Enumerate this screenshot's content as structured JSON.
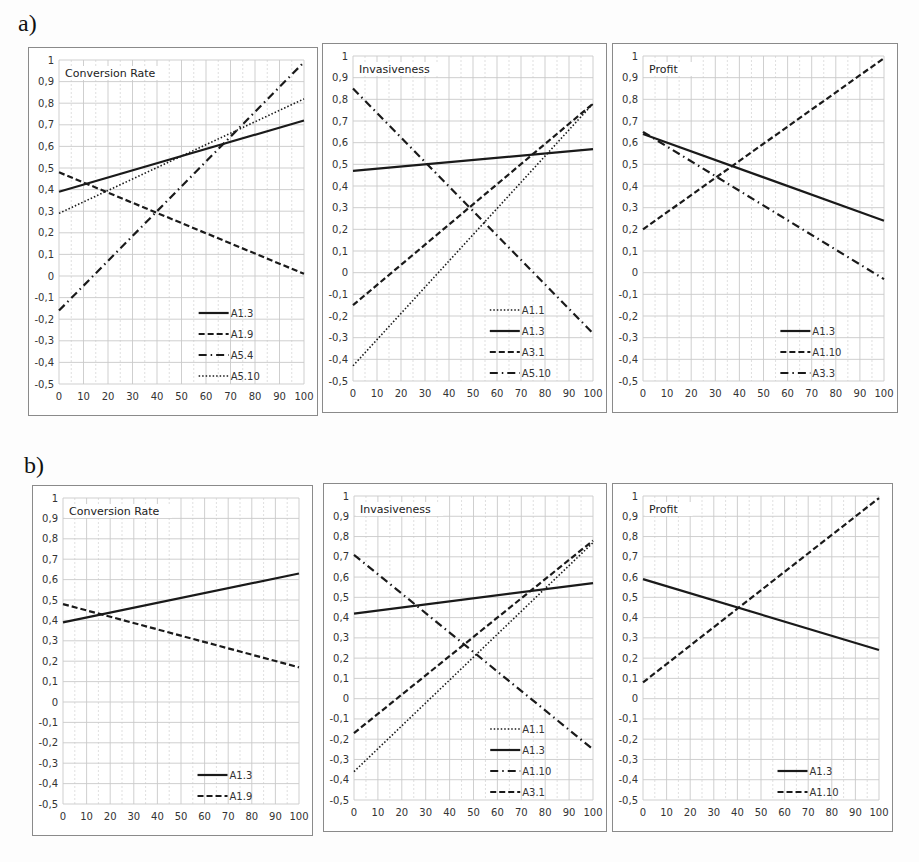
{
  "labels": {
    "row_a": "a)",
    "row_b": "b)"
  },
  "chart_data": [
    {
      "id": "a1",
      "row": "a",
      "type": "line",
      "title": "Conversion Rate",
      "xlabel": "",
      "ylabel": "",
      "x_ticks": [
        "0",
        "10",
        "20",
        "30",
        "40",
        "50",
        "60",
        "70",
        "80",
        "90",
        "100"
      ],
      "y_ticks": [
        "1",
        "0,9",
        "0,8",
        "0,7",
        "0,6",
        "0,5",
        "0,4",
        "0,3",
        "0,2",
        "0,1",
        "0",
        "-0,1",
        "-0,2",
        "-0,3",
        "-0,4",
        "-0,5"
      ],
      "xlim": [
        0,
        100
      ],
      "ylim": [
        -0.5,
        1
      ],
      "grid": true,
      "legend_position": "lower-right",
      "series": [
        {
          "name": "A1.3",
          "style": "solid",
          "x": [
            0,
            100
          ],
          "values": [
            0.39,
            0.72
          ]
        },
        {
          "name": "A1.9",
          "style": "dashed",
          "x": [
            0,
            100
          ],
          "values": [
            0.48,
            0.01
          ]
        },
        {
          "name": "A5.4",
          "style": "dashdot",
          "x": [
            0,
            100
          ],
          "values": [
            -0.16,
            0.99
          ]
        },
        {
          "name": "A5.10",
          "style": "dotted",
          "x": [
            0,
            100
          ],
          "values": [
            0.29,
            0.82
          ]
        }
      ]
    },
    {
      "id": "a2",
      "row": "a",
      "type": "line",
      "title": "Invasiveness",
      "xlabel": "",
      "ylabel": "",
      "x_ticks": [
        "0",
        "10",
        "20",
        "30",
        "40",
        "50",
        "60",
        "70",
        "80",
        "90",
        "100"
      ],
      "y_ticks": [
        "1",
        "0,9",
        "0,8",
        "0,7",
        "0,6",
        "0,5",
        "0,4",
        "0,3",
        "0,2",
        "0,1",
        "0",
        "-0,1",
        "-0,2",
        "-0,3",
        "-0,4",
        "-0,5"
      ],
      "xlim": [
        0,
        100
      ],
      "ylim": [
        -0.5,
        1
      ],
      "grid": true,
      "legend_position": "lower-right",
      "series": [
        {
          "name": "A1.1",
          "style": "dotted",
          "x": [
            0,
            100
          ],
          "values": [
            -0.43,
            0.78
          ]
        },
        {
          "name": "A1.3",
          "style": "solid",
          "x": [
            0,
            100
          ],
          "values": [
            0.47,
            0.57
          ]
        },
        {
          "name": "A3.1",
          "style": "dashed",
          "x": [
            0,
            100
          ],
          "values": [
            -0.15,
            0.78
          ]
        },
        {
          "name": "A5.10",
          "style": "dashdot",
          "x": [
            0,
            100
          ],
          "values": [
            0.85,
            -0.28
          ]
        }
      ]
    },
    {
      "id": "a3",
      "row": "a",
      "type": "line",
      "title": "Profit",
      "xlabel": "",
      "ylabel": "",
      "x_ticks": [
        "0",
        "10",
        "20",
        "30",
        "40",
        "50",
        "60",
        "70",
        "80",
        "90",
        "100"
      ],
      "y_ticks": [
        "1",
        "0,9",
        "0,8",
        "0,7",
        "0,6",
        "0,5",
        "0,4",
        "0,3",
        "0,2",
        "0,1",
        "0",
        "-0,1",
        "-0,2",
        "-0,3",
        "-0,4",
        "-0,5"
      ],
      "xlim": [
        0,
        100
      ],
      "ylim": [
        -0.5,
        1
      ],
      "grid": true,
      "legend_position": "lower-right",
      "series": [
        {
          "name": "A1.3",
          "style": "solid",
          "x": [
            0,
            100
          ],
          "values": [
            0.64,
            0.24
          ]
        },
        {
          "name": "A1.10",
          "style": "dashed",
          "x": [
            0,
            100
          ],
          "values": [
            0.2,
            0.99
          ]
        },
        {
          "name": "A3.3",
          "style": "dashdot",
          "x": [
            0,
            100
          ],
          "values": [
            0.65,
            -0.03
          ]
        }
      ]
    },
    {
      "id": "b1",
      "row": "b",
      "type": "line",
      "title": "Conversion Rate",
      "xlabel": "",
      "ylabel": "",
      "x_ticks": [
        "0",
        "10",
        "20",
        "30",
        "40",
        "50",
        "60",
        "70",
        "80",
        "90",
        "100"
      ],
      "y_ticks": [
        "1",
        "0,9",
        "0,8",
        "0,7",
        "0,6",
        "0,5",
        "0,4",
        "0,3",
        "0,2",
        "0,1",
        "0",
        "-0,1",
        "-0,2",
        "-0,3",
        "-0,4",
        "-0,5"
      ],
      "xlim": [
        0,
        100
      ],
      "ylim": [
        -0.5,
        1
      ],
      "grid": true,
      "legend_position": "lower-right",
      "series": [
        {
          "name": "A1.3",
          "style": "solid",
          "x": [
            0,
            100
          ],
          "values": [
            0.39,
            0.63
          ]
        },
        {
          "name": "A1.9",
          "style": "dashed",
          "x": [
            0,
            100
          ],
          "values": [
            0.48,
            0.17
          ]
        }
      ]
    },
    {
      "id": "b2",
      "row": "b",
      "type": "line",
      "title": "Invasiveness",
      "xlabel": "",
      "ylabel": "",
      "x_ticks": [
        "0",
        "10",
        "20",
        "30",
        "40",
        "50",
        "60",
        "70",
        "80",
        "90",
        "100"
      ],
      "y_ticks": [
        "1",
        "0,9",
        "0,8",
        "0,7",
        "0,6",
        "0,5",
        "0,4",
        "0,3",
        "0,2",
        "0,1",
        "0",
        "-0,1",
        "-0,2",
        "-0,3",
        "-0,4",
        "-0,5"
      ],
      "xlim": [
        0,
        100
      ],
      "ylim": [
        -0.5,
        1
      ],
      "grid": true,
      "legend_position": "lower-right",
      "series": [
        {
          "name": "A1.1",
          "style": "dotted",
          "x": [
            0,
            100
          ],
          "values": [
            -0.36,
            0.77
          ]
        },
        {
          "name": "A1.3",
          "style": "solid",
          "x": [
            0,
            100
          ],
          "values": [
            0.42,
            0.57
          ]
        },
        {
          "name": "A1.10",
          "style": "dashdot",
          "x": [
            0,
            100
          ],
          "values": [
            0.71,
            -0.25
          ]
        },
        {
          "name": "A3.1",
          "style": "dashed",
          "x": [
            0,
            100
          ],
          "values": [
            -0.17,
            0.78
          ]
        }
      ]
    },
    {
      "id": "b3",
      "row": "b",
      "type": "line",
      "title": "Profit",
      "xlabel": "",
      "ylabel": "",
      "x_ticks": [
        "0",
        "10",
        "20",
        "30",
        "40",
        "50",
        "60",
        "70",
        "80",
        "90",
        "100"
      ],
      "y_ticks": [
        "1",
        "0,9",
        "0,8",
        "0,7",
        "0,6",
        "0,5",
        "0,4",
        "0,3",
        "0,2",
        "0,1",
        "0",
        "-0,1",
        "-0,2",
        "-0,3",
        "-0,4",
        "-0,5"
      ],
      "xlim": [
        0,
        100
      ],
      "ylim": [
        -0.5,
        1
      ],
      "grid": true,
      "legend_position": "lower-right",
      "series": [
        {
          "name": "A1.3",
          "style": "solid",
          "x": [
            0,
            100
          ],
          "values": [
            0.59,
            0.24
          ]
        },
        {
          "name": "A1.10",
          "style": "dashed",
          "x": [
            0,
            100
          ],
          "values": [
            0.08,
            0.99
          ]
        }
      ]
    }
  ],
  "layout": {
    "panels": {
      "a1": {
        "left": 28,
        "top": 47,
        "width": 290,
        "height": 369
      },
      "a2": {
        "left": 322,
        "top": 43,
        "width": 285,
        "height": 370
      },
      "a3": {
        "left": 612,
        "top": 43,
        "width": 286,
        "height": 370
      },
      "b1": {
        "left": 32,
        "top": 485,
        "width": 281,
        "height": 351
      },
      "b2": {
        "left": 323,
        "top": 483,
        "width": 284,
        "height": 349
      },
      "b3": {
        "left": 612,
        "top": 483,
        "width": 281,
        "height": 349
      }
    },
    "colors": {
      "line": "#1a1a1a",
      "grid": "#c9c9c9",
      "border": "#8a8a8a"
    }
  }
}
